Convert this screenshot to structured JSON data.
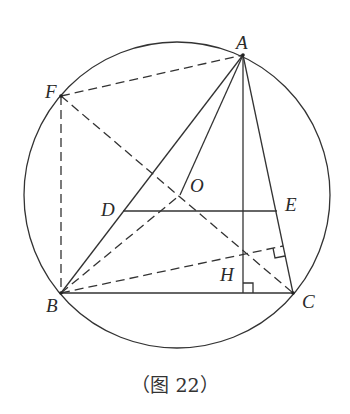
{
  "figure": {
    "caption": "（图 22）",
    "circle": {
      "cx": 177,
      "cy": 195,
      "r": 153
    },
    "points": {
      "A": {
        "label": "A",
        "x": 243,
        "y": 55
      },
      "F": {
        "label": "F",
        "x": 61,
        "y": 96
      },
      "B": {
        "label": "B",
        "x": 61,
        "y": 293
      },
      "C": {
        "label": "C",
        "x": 293,
        "y": 293
      },
      "O": {
        "label": "O",
        "x": 180,
        "y": 195
      },
      "D": {
        "label": "D",
        "x": 123,
        "y": 211
      },
      "E": {
        "label": "E",
        "x": 277,
        "y": 211
      },
      "H": {
        "label": "H",
        "x": 243,
        "y": 253
      }
    },
    "solid_segments": [
      "AB",
      "AC",
      "BC",
      "AO",
      "DE",
      "AH-foot"
    ],
    "dashed_segments": [
      "FA",
      "FB",
      "FC",
      "BO",
      "BH-extended"
    ],
    "right_angle_marks": [
      "foot of altitude from A on BC",
      "foot of perpendicular from B on AC"
    ]
  }
}
